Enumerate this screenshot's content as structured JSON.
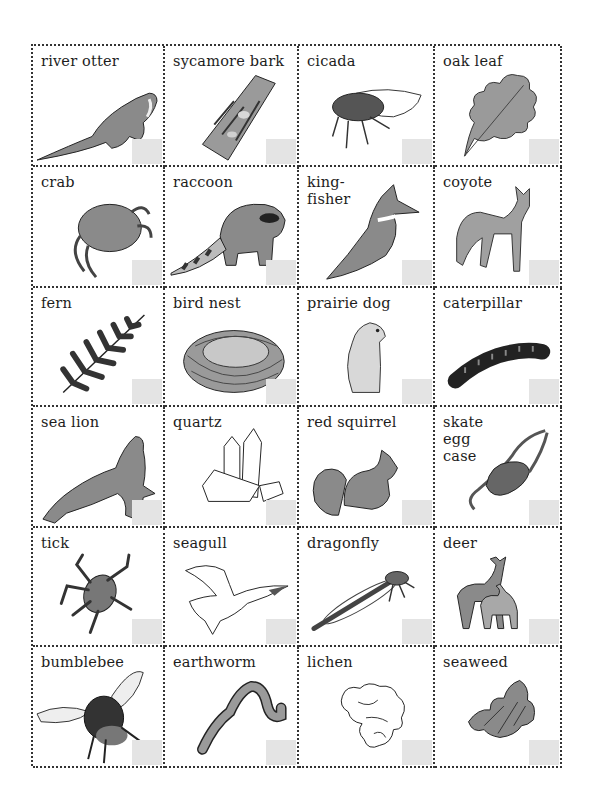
{
  "sheet": {
    "title": "",
    "colors": {
      "border": "#333333",
      "check_box": "#e4e4e4",
      "ink": "#1d1d1d",
      "fill": "#8a8a8a"
    },
    "cards": [
      {
        "label": "river otter",
        "icon": "otter-icon"
      },
      {
        "label": "sycamore bark",
        "icon": "bark-icon"
      },
      {
        "label": "cicada",
        "icon": "cicada-icon"
      },
      {
        "label": "oak leaf",
        "icon": "oak-leaf-icon"
      },
      {
        "label": "crab",
        "icon": "crab-icon"
      },
      {
        "label": "raccoon",
        "icon": "raccoon-icon"
      },
      {
        "label": "king-\nfisher",
        "icon": "kingfisher-icon"
      },
      {
        "label": "coyote",
        "icon": "coyote-icon"
      },
      {
        "label": "fern",
        "icon": "fern-icon"
      },
      {
        "label": "bird nest",
        "icon": "bird-nest-icon"
      },
      {
        "label": "prairie dog",
        "icon": "prairie-dog-icon"
      },
      {
        "label": "caterpillar",
        "icon": "caterpillar-icon"
      },
      {
        "label": "sea lion",
        "icon": "sea-lion-icon"
      },
      {
        "label": "quartz",
        "icon": "quartz-icon"
      },
      {
        "label": "red squirrel",
        "icon": "squirrel-icon"
      },
      {
        "label": "skate\negg\ncase",
        "icon": "skate-egg-case-icon"
      },
      {
        "label": "tick",
        "icon": "tick-icon"
      },
      {
        "label": "seagull",
        "icon": "seagull-icon"
      },
      {
        "label": "dragonfly",
        "icon": "dragonfly-icon"
      },
      {
        "label": "deer",
        "icon": "deer-icon"
      },
      {
        "label": "bumblebee",
        "icon": "bumblebee-icon"
      },
      {
        "label": "earthworm",
        "icon": "earthworm-icon"
      },
      {
        "label": "lichen",
        "icon": "lichen-icon"
      },
      {
        "label": "seaweed",
        "icon": "seaweed-icon"
      }
    ]
  }
}
